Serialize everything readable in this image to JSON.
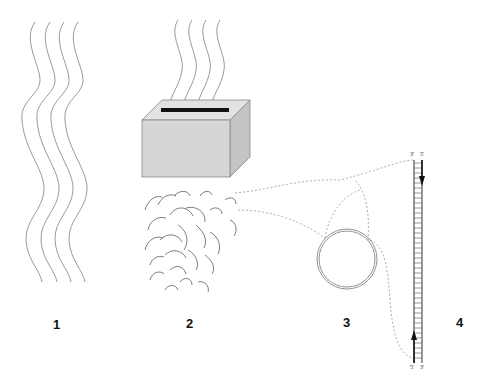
{
  "panels": [
    {
      "id": 1,
      "label": "1",
      "content": "four wavy strands"
    },
    {
      "id": 2,
      "label": "2",
      "content": "box with slot receiving strands; fragments below"
    },
    {
      "id": 3,
      "label": "3",
      "content": "double-stranded circle"
    },
    {
      "id": 4,
      "label": "4",
      "content": "double-stranded ladder"
    }
  ],
  "ladder": {
    "top_left_end": "3'",
    "top_right_end": "5'",
    "bottom_left_end": "5'",
    "bottom_right_end": "3'"
  },
  "colors": {
    "strand": "#9a9a9a",
    "box_front": "#d6d6d6",
    "box_top": "#e2e2e2",
    "box_side": "#c4c4c4",
    "slot": "#111111",
    "dashed": "#9a9a9a",
    "text": "#111111"
  }
}
